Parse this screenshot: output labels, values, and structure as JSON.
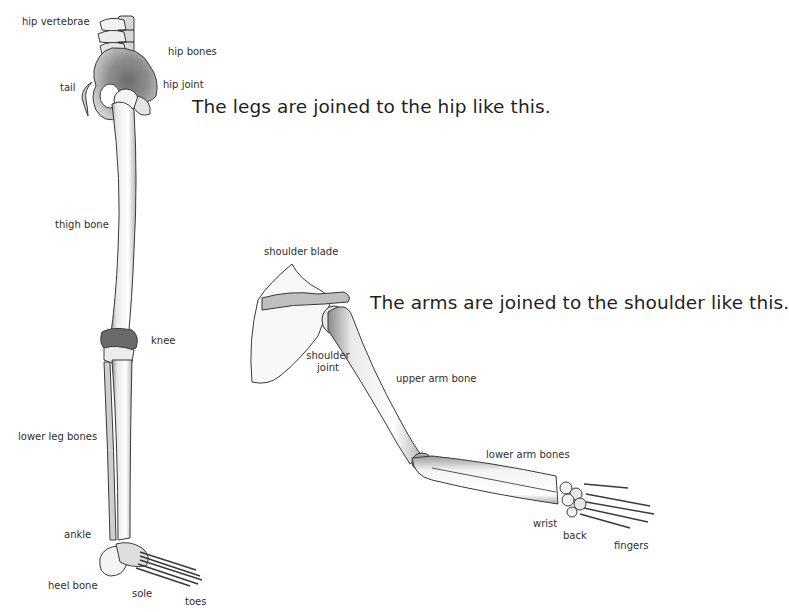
{
  "captions": {
    "legs": "The legs are joined to the hip like this.",
    "arms": "The arms are joined to the shoulder like this."
  },
  "leg_labels": {
    "hip_vertebrae": "hip vertebrae",
    "hip_bones": "hip bones",
    "tail": "tail",
    "hip_joint": "hip joint",
    "thigh_bone": "thigh bone",
    "knee": "knee",
    "lower_leg_bones": "lower leg bones",
    "ankle": "ankle",
    "heel_bone": "heel bone",
    "sole": "sole",
    "toes": "toes"
  },
  "arm_labels": {
    "shoulder_blade": "shoulder blade",
    "shoulder_joint_line1": "shoulder",
    "shoulder_joint_line2": "joint",
    "upper_arm_bone": "upper arm bone",
    "lower_arm_bones": "lower arm bones",
    "wrist": "wrist",
    "back": "back",
    "fingers": "fingers"
  }
}
